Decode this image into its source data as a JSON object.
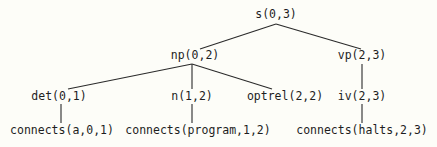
{
  "diagram": {
    "type": "parse-tree",
    "background": "#fdfdf8",
    "line_color": "#2a2a2a",
    "nodes": [
      {
        "id": "s",
        "label": "s(0,3)",
        "x": 276,
        "y": 15
      },
      {
        "id": "np",
        "label": "np(0,2)",
        "x": 195,
        "y": 56
      },
      {
        "id": "vp",
        "label": "vp(2,3)",
        "x": 362,
        "y": 56
      },
      {
        "id": "det",
        "label": "det(0,1)",
        "x": 59,
        "y": 97
      },
      {
        "id": "n",
        "label": "n(1,2)",
        "x": 192,
        "y": 97
      },
      {
        "id": "optrel",
        "label": "optrel(2,2)",
        "x": 285,
        "y": 97
      },
      {
        "id": "iv",
        "label": "iv(2,3)",
        "x": 362,
        "y": 97
      },
      {
        "id": "c_a",
        "label": "connects(a,0,1)",
        "x": 62,
        "y": 131
      },
      {
        "id": "c_prog",
        "label": "connects(program,1,2)",
        "x": 198,
        "y": 131
      },
      {
        "id": "c_halts",
        "label": "connects(halts,2,3)",
        "x": 362,
        "y": 131
      }
    ],
    "edges": [
      {
        "from": "s",
        "to": "np",
        "x1": 276,
        "y1": 24,
        "x2": 200,
        "y2": 49
      },
      {
        "from": "s",
        "to": "vp",
        "x1": 276,
        "y1": 24,
        "x2": 361,
        "y2": 49
      },
      {
        "from": "np",
        "to": "det",
        "x1": 192,
        "y1": 64,
        "x2": 68,
        "y2": 89
      },
      {
        "from": "np",
        "to": "n",
        "x1": 192,
        "y1": 64,
        "x2": 192,
        "y2": 89
      },
      {
        "from": "np",
        "to": "optrel",
        "x1": 192,
        "y1": 64,
        "x2": 272,
        "y2": 89
      },
      {
        "from": "vp",
        "to": "iv",
        "x1": 362,
        "y1": 64,
        "x2": 362,
        "y2": 89
      },
      {
        "from": "det",
        "to": "c_a",
        "x1": 61,
        "y1": 104,
        "x2": 61,
        "y2": 123
      },
      {
        "from": "n",
        "to": "c_prog",
        "x1": 192,
        "y1": 104,
        "x2": 192,
        "y2": 123
      },
      {
        "from": "iv",
        "to": "c_halts",
        "x1": 362,
        "y1": 104,
        "x2": 362,
        "y2": 123
      }
    ]
  }
}
